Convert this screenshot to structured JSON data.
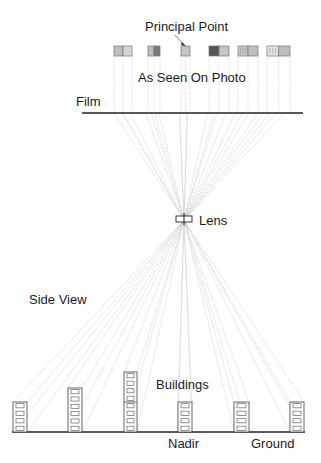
{
  "labels": {
    "principal_point": "Principal Point",
    "as_seen_on_photo": "As Seen On Photo",
    "film": "Film",
    "lens": "Lens",
    "side_view": "Side View",
    "buildings": "Buildings",
    "nadir": "Nadir",
    "ground": "Ground"
  },
  "geometry": {
    "lens_center": [
      184,
      220
    ],
    "film_line": {
      "y": 113,
      "x1": 82,
      "x2": 303
    },
    "ground_line": {
      "y": 432,
      "x1": 12,
      "x2": 305
    }
  },
  "photo_thumbnails": [
    {
      "id": "t1",
      "x": 114,
      "w": 18,
      "fill_left": "#bdbdbd",
      "fill_right": "#d6d6d6",
      "pattern": "light"
    },
    {
      "id": "t2",
      "x": 148,
      "w": 12,
      "fill_left": "#bdbdbd",
      "fill_right": "#7a7a7a",
      "pattern": "dark"
    },
    {
      "id": "t3",
      "x": 181,
      "w": 9,
      "fill_left": "#c4c4c4",
      "fill_right": "#c4c4c4",
      "pattern": "principal"
    },
    {
      "id": "t4",
      "x": 209,
      "w": 20,
      "fill_left": "#555555",
      "fill_right": "#c4c4c4",
      "pattern": "dark"
    },
    {
      "id": "t5",
      "x": 238,
      "w": 20,
      "fill_left": "#c8c8c8",
      "fill_right": "#bdbdbd",
      "pattern": "striped"
    },
    {
      "id": "t6",
      "x": 267,
      "w": 23,
      "fill_left": "#e6e6e6",
      "fill_right": "#bdbdbd",
      "pattern": "windows"
    }
  ],
  "buildings": [
    {
      "id": "b1",
      "x": 13,
      "w": 14,
      "top": 402,
      "floors": 4
    },
    {
      "id": "b2",
      "x": 68,
      "w": 14,
      "top": 388,
      "floors": 6
    },
    {
      "id": "b3",
      "x": 124,
      "w": 13,
      "top": 372,
      "floors": 8
    },
    {
      "id": "b4",
      "x": 178,
      "w": 14,
      "top": 402,
      "floors": 4
    },
    {
      "id": "b5",
      "x": 234,
      "w": 15,
      "top": 402,
      "floors": 4
    },
    {
      "id": "b6",
      "x": 290,
      "w": 14,
      "top": 402,
      "floors": 4
    }
  ]
}
